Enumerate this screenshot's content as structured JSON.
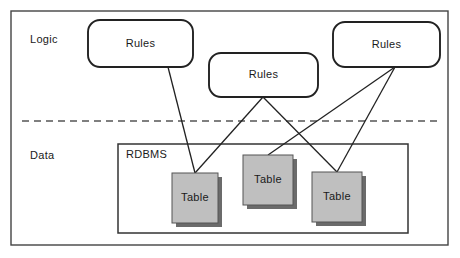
{
  "diagram": {
    "outer_frame": {
      "x": 11,
      "y": 11,
      "width": 437,
      "height": 234,
      "stroke": "#444444"
    },
    "divider": {
      "y": 121,
      "x1": 22,
      "x2": 437,
      "style": "dashed",
      "stroke": "#555555"
    },
    "layers": [
      {
        "name": "logic-layer-label",
        "label": "Logic",
        "x": 30,
        "y": 33
      },
      {
        "name": "data-layer-label",
        "label": "Data",
        "x": 30,
        "y": 149
      }
    ],
    "containers": [
      {
        "name": "rdbms-container",
        "label": "RDBMS",
        "x": 118,
        "y": 144,
        "width": 290,
        "height": 89,
        "label_x": 126,
        "label_y": 148,
        "stroke": "#333333",
        "fill": "#ffffff"
      }
    ],
    "rules_nodes": [
      {
        "name": "rules-box-1",
        "label": "Rules",
        "x": 88,
        "y": 20,
        "width": 105,
        "height": 47
      },
      {
        "name": "rules-box-2",
        "label": "Rules",
        "x": 209,
        "y": 53,
        "width": 109,
        "height": 44
      },
      {
        "name": "rules-box-3",
        "label": "Rules",
        "x": 333,
        "y": 22,
        "width": 107,
        "height": 45
      }
    ],
    "table_nodes": [
      {
        "name": "table-box-1",
        "label": "Table",
        "x": 172,
        "y": 173,
        "width": 46,
        "height": 50
      },
      {
        "name": "table-box-2",
        "label": "Table",
        "x": 243,
        "y": 155,
        "width": 50,
        "height": 50
      },
      {
        "name": "table-box-3",
        "label": "Table",
        "x": 312,
        "y": 172,
        "width": 50,
        "height": 50
      }
    ],
    "connectors": [
      {
        "name": "connector-rules1-table1",
        "from": "rules-box-1",
        "to": "table-box-1",
        "x1": 168,
        "y1": 67,
        "x2": 195,
        "y2": 173
      },
      {
        "name": "connector-rules2-table1",
        "from": "rules-box-2",
        "to": "table-box-1",
        "x1": 263,
        "y1": 97,
        "x2": 195,
        "y2": 173
      },
      {
        "name": "connector-rules2-table3",
        "from": "rules-box-2",
        "to": "table-box-3",
        "x1": 263,
        "y1": 97,
        "x2": 337,
        "y2": 172
      },
      {
        "name": "connector-rules3-table2",
        "from": "rules-box-3",
        "to": "table-box-2",
        "x1": 395,
        "y1": 67,
        "x2": 268,
        "y2": 155
      },
      {
        "name": "connector-rules3-table3",
        "from": "rules-box-3",
        "to": "table-box-3",
        "x1": 395,
        "y1": 67,
        "x2": 337,
        "y2": 172
      }
    ],
    "colors": {
      "table_fill": "#bfbfbf",
      "table_stroke": "#555555",
      "table_shadow": "#6b6b6b",
      "rules_stroke": "#222222",
      "rules_fill": "#ffffff",
      "frame_stroke": "#444444",
      "text": "#1a1a1a",
      "background": "#ffffff"
    }
  }
}
